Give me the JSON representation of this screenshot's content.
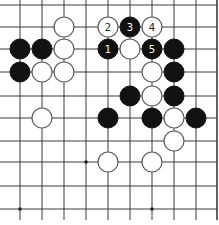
{
  "board": {
    "title": "Go problem diagram",
    "grid_x": [
      20,
      42,
      64,
      86,
      108,
      130,
      152,
      174,
      196,
      217
    ],
    "grid_y": [
      5,
      27,
      49,
      72,
      96,
      118,
      141,
      162,
      186,
      209
    ],
    "line_bottom_extent": 220,
    "right_edge_x": 217,
    "stone_radius": 10,
    "colors": {
      "black": "#111111",
      "white": "#ffffff",
      "line": "#3a3a3a"
    },
    "star_points": [
      {
        "col": 3,
        "row": 7
      },
      {
        "col": 0,
        "row": 9
      },
      {
        "col": 6,
        "row": 9
      }
    ],
    "stones": [
      {
        "color": "white",
        "col": 2,
        "row": 1,
        "label": ""
      },
      {
        "color": "white",
        "col": 4,
        "row": 1,
        "label": "2"
      },
      {
        "color": "black",
        "col": 5,
        "row": 1,
        "label": "3"
      },
      {
        "color": "white",
        "col": 6,
        "row": 1,
        "label": "4"
      },
      {
        "color": "black",
        "col": 0,
        "row": 2,
        "label": ""
      },
      {
        "color": "black",
        "col": 1,
        "row": 2,
        "label": ""
      },
      {
        "color": "white",
        "col": 2,
        "row": 2,
        "label": ""
      },
      {
        "color": "black",
        "col": 4,
        "row": 2,
        "label": "1"
      },
      {
        "color": "white",
        "col": 5,
        "row": 2,
        "label": ""
      },
      {
        "color": "black",
        "col": 6,
        "row": 2,
        "label": "5"
      },
      {
        "color": "black",
        "col": 7,
        "row": 2,
        "label": ""
      },
      {
        "color": "black",
        "col": 0,
        "row": 3,
        "label": ""
      },
      {
        "color": "white",
        "col": 1,
        "row": 3,
        "label": ""
      },
      {
        "color": "white",
        "col": 2,
        "row": 3,
        "label": ""
      },
      {
        "color": "white",
        "col": 6,
        "row": 3,
        "label": ""
      },
      {
        "color": "black",
        "col": 7,
        "row": 3,
        "label": ""
      },
      {
        "color": "black",
        "col": 5,
        "row": 4,
        "label": ""
      },
      {
        "color": "white",
        "col": 6,
        "row": 4,
        "label": ""
      },
      {
        "color": "black",
        "col": 7,
        "row": 4,
        "label": ""
      },
      {
        "color": "white",
        "col": 1,
        "row": 5,
        "label": ""
      },
      {
        "color": "black",
        "col": 4,
        "row": 5,
        "label": ""
      },
      {
        "color": "black",
        "col": 6,
        "row": 5,
        "label": ""
      },
      {
        "color": "white",
        "col": 7,
        "row": 5,
        "label": ""
      },
      {
        "color": "black",
        "col": 8,
        "row": 5,
        "label": ""
      },
      {
        "color": "white",
        "col": 7,
        "row": 6,
        "label": ""
      },
      {
        "color": "white",
        "col": 4,
        "row": 7,
        "label": ""
      },
      {
        "color": "white",
        "col": 6,
        "row": 7,
        "label": ""
      }
    ]
  }
}
